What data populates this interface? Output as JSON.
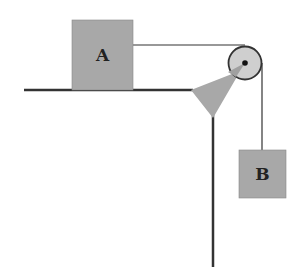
{
  "diagram": {
    "blocks": [
      {
        "id": "A",
        "label": "A"
      },
      {
        "id": "B",
        "label": "B"
      }
    ],
    "colors": {
      "block_fill": "#a8a8a8",
      "pulley_fill": "#c8c8c8",
      "line": "#333333"
    }
  }
}
